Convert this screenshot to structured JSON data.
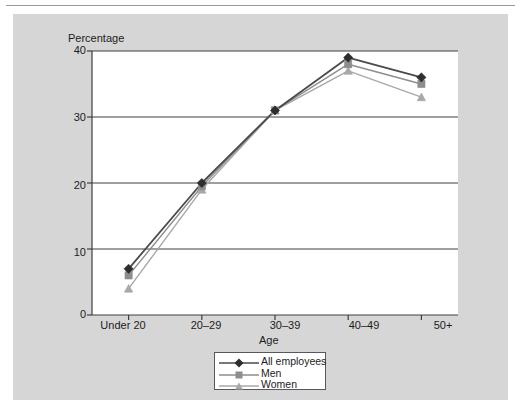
{
  "chart_data": {
    "type": "line",
    "title": "",
    "subtitle": "",
    "xlabel": "Age",
    "ylabel": "Percentage",
    "categories": [
      "Under 20",
      "20–29",
      "30–39",
      "40–49",
      "50+"
    ],
    "series": [
      {
        "name": "All employees",
        "values": [
          7,
          20,
          31,
          39,
          36
        ],
        "color": "#4a4a4a",
        "marker": "diamond"
      },
      {
        "name": "Men",
        "values": [
          6,
          19.5,
          31,
          38,
          35
        ],
        "color": "#8d8d8d",
        "marker": "square"
      },
      {
        "name": "Women",
        "values": [
          4,
          19,
          31,
          37,
          33
        ],
        "color": "#a8a8a8",
        "marker": "triangle"
      }
    ],
    "ylim": [
      0,
      40
    ],
    "yticks": [
      0,
      10,
      20,
      30,
      40
    ],
    "ytick_labels": [
      "0",
      "10",
      "20",
      "30",
      "40"
    ],
    "gridlines": [
      10,
      20,
      30,
      40
    ],
    "grid": true,
    "legend_position": "bottom-center"
  },
  "axes": {
    "y_title": "Percentage",
    "x_title": "Age",
    "y_tick_labels": [
      "40",
      "30",
      "20",
      "10",
      "0"
    ],
    "x_tick_labels": [
      "Under 20",
      "20–29",
      "30–39",
      "40–49",
      "50+"
    ]
  },
  "legend": {
    "entries": [
      {
        "label": "All employees"
      },
      {
        "label": "Men"
      },
      {
        "label": "Women"
      }
    ]
  },
  "colors": {
    "page_background": "#ffffff",
    "panel_background": "#d6d6d6",
    "plot_background": "#ffffff",
    "axis": "#3c3f42",
    "gridline": "#3c3f42",
    "series_all_employees": "#4a4a4a",
    "series_men": "#8d8d8d",
    "series_women": "#a8a8a8",
    "text": "#1c1c1c",
    "top_rule": "#9a9a9a"
  }
}
